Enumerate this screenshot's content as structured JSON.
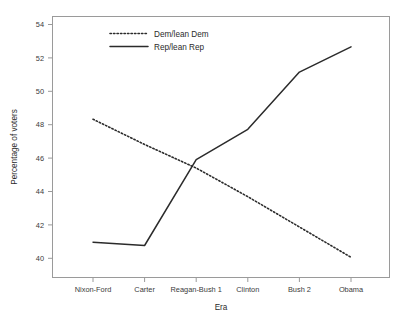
{
  "chart_data": {
    "type": "line",
    "title": "",
    "xlabel": "Era",
    "ylabel": "Percentage of voters",
    "categories": [
      "Nixon-Ford",
      "Carter",
      "Reagan-Bush 1",
      "Clinton",
      "Bush 2",
      "Obama"
    ],
    "yticks": [
      40,
      42,
      44,
      46,
      48,
      50,
      52,
      54
    ],
    "ylim": [
      39.3,
      54.8
    ],
    "grid": false,
    "legend_position": "top-center",
    "series": [
      {
        "name": "Dem/lean Dem",
        "style": "dotted",
        "color": "#2b2b2b",
        "values": [
          48.7,
          47.2,
          45.8,
          44.1,
          42.3,
          40.5
        ]
      },
      {
        "name": "Rep/lean Rep",
        "style": "solid",
        "color": "#2b2b2b",
        "values": [
          41.4,
          41.2,
          46.3,
          48.1,
          51.5,
          53.0
        ]
      }
    ]
  },
  "axis": {
    "y_label": "Percentage of voters",
    "x_label": "Era",
    "y_tick_labels": [
      "40",
      "42",
      "44",
      "46",
      "48",
      "50",
      "52",
      "54"
    ],
    "x_tick_labels": [
      "Nixon-Ford",
      "Carter",
      "Reagan-Bush 1",
      "Clinton",
      "Bush 2",
      "Obama"
    ]
  },
  "legend": {
    "entries": [
      {
        "label": "Dem/lean Dem"
      },
      {
        "label": "Rep/lean Rep"
      }
    ]
  }
}
